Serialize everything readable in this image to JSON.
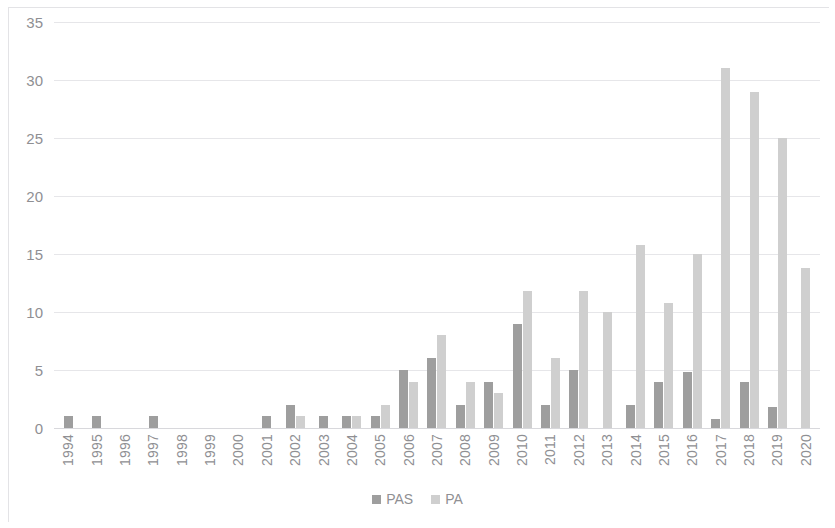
{
  "chart_data": {
    "type": "bar",
    "title": "",
    "subtitle": "",
    "xlabel": "",
    "ylabel": "",
    "ylim": [
      0,
      35
    ],
    "ytick_step": 5,
    "yticks": [
      "35",
      "30",
      "25",
      "20",
      "15",
      "10",
      "5",
      "0"
    ],
    "grid": true,
    "legend_position": "bottom",
    "categories": [
      "1994",
      "1995",
      "1996",
      "1997",
      "1998",
      "1999",
      "2000",
      "2001",
      "2002",
      "2003",
      "2004",
      "2005",
      "2006",
      "2007",
      "2008",
      "2009",
      "2010",
      "2011",
      "2012",
      "2013",
      "2014",
      "2015",
      "2016",
      "2017",
      "2018",
      "2019",
      "2020"
    ],
    "series": [
      {
        "name": "PAS",
        "color": "#9e9e9e",
        "values": [
          1,
          1,
          0,
          1,
          0,
          0,
          0,
          1,
          2,
          1,
          1,
          1,
          5,
          6,
          2,
          4,
          9,
          2,
          5,
          0,
          2,
          4,
          4.8,
          0.8,
          4,
          1.8,
          0
        ]
      },
      {
        "name": "PA",
        "color": "#cfcfcf",
        "values": [
          0,
          0,
          0,
          0,
          0,
          0,
          0,
          0,
          1,
          0,
          1,
          2,
          4,
          8,
          4,
          3,
          11.8,
          6,
          11.8,
          10,
          15.8,
          10.8,
          15,
          31,
          29,
          25,
          13.8
        ]
      }
    ]
  },
  "legend": {
    "items": [
      {
        "label": "PAS",
        "swatch": "pas"
      },
      {
        "label": "PA",
        "swatch": "pa"
      }
    ]
  }
}
